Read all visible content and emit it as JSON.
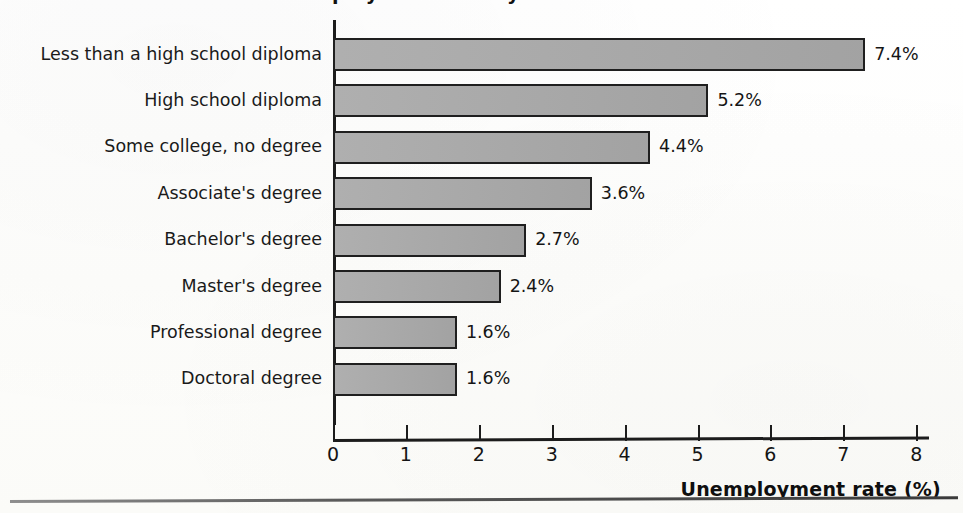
{
  "figure": {
    "title": "Unemployment rate by education level",
    "title_visible": "partially cut off at top edge",
    "background_color": "#fdfdfb",
    "bar_fill_color": "#a9a9a9",
    "bar_border_color": "#1f1f1f",
    "axis_color": "#1c1c1c"
  },
  "chart_data": {
    "type": "bar",
    "orientation": "horizontal",
    "title": "Unemployment rate by education level",
    "xlabel": "Unemployment rate (%)",
    "ylabel": "",
    "xlim": [
      0,
      8
    ],
    "xticks": [
      0,
      1,
      2,
      3,
      4,
      5,
      6,
      7,
      8
    ],
    "xtick_labels": [
      "0",
      "1",
      "2",
      "3",
      "4",
      "5",
      "6",
      "7",
      "8"
    ],
    "grid": false,
    "legend": false,
    "categories": [
      "Less than a high school diploma",
      "High school diploma",
      "Some college, no degree",
      "Associate's degree",
      "Bachelor's degree",
      "Master's degree",
      "Professional degree",
      "Doctoral degree"
    ],
    "values": [
      7.4,
      5.2,
      4.4,
      3.6,
      2.7,
      2.4,
      1.6,
      1.6
    ],
    "value_labels": [
      "7.4%",
      "5.2%",
      "4.4%",
      "3.6%",
      "2.7%",
      "2.4%",
      "1.6%",
      "1.6%"
    ],
    "bar_lengths_units": [
      7.3,
      5.15,
      4.35,
      3.55,
      2.65,
      2.3,
      1.7,
      1.7
    ]
  },
  "axis": {
    "x_title": "Unemployment rate (%)"
  }
}
